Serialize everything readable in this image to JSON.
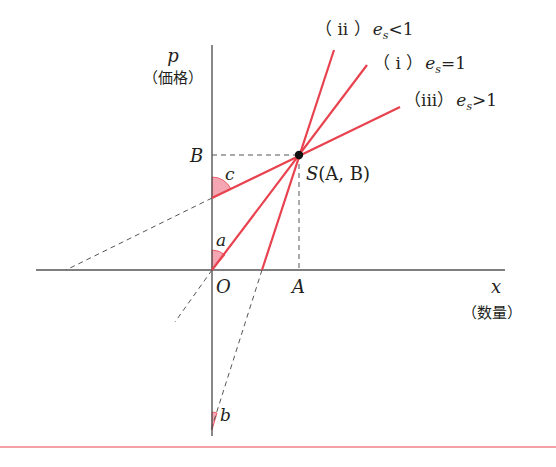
{
  "diagram": {
    "type": "supply-elasticity-diagram",
    "axes": {
      "y": {
        "symbol": "p",
        "label": "（価格）"
      },
      "x": {
        "symbol": "x",
        "label": "（数量）"
      },
      "origin": "O"
    },
    "point": {
      "name": "S",
      "coords": "(A, B)",
      "x_label": "A",
      "y_label": "B"
    },
    "angles": {
      "a": "a",
      "b": "b",
      "c": "c"
    },
    "lines": [
      {
        "id": "i",
        "numeral": "（ i ）",
        "var": "e",
        "sub": "s",
        "relation": "=",
        "value": "1"
      },
      {
        "id": "ii",
        "numeral": "（ ii ）",
        "var": "e",
        "sub": "s",
        "relation": "<",
        "value": "1"
      },
      {
        "id": "iii",
        "numeral": "（iii）",
        "var": "e",
        "sub": "s",
        "relation": ">",
        "value": "1"
      }
    ],
    "colors": {
      "supply_line": "#e8424f",
      "angle_fill": "#f4a6b3",
      "axis": "#555555",
      "guide": "#555555",
      "separator": "#e8424f"
    }
  }
}
